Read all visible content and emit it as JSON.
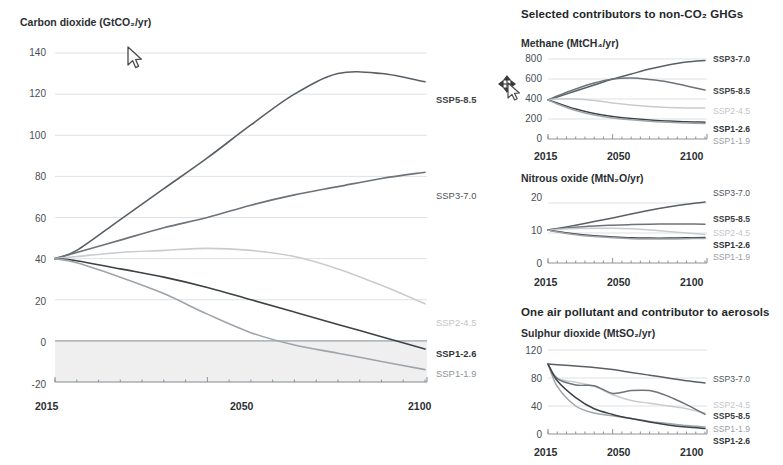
{
  "figure": {
    "top_cut_text": "",
    "cursors": [
      {
        "name": "arrow-cursor",
        "x": 128,
        "y": 50,
        "type": "arrow"
      },
      {
        "name": "move-cursor",
        "x": 500,
        "y": 78,
        "type": "move"
      }
    ]
  },
  "colors": {
    "ssp5_8_5": "#595f64",
    "ssp3_7_0": "#6d7378",
    "ssp2_4_5": "#c9cccf",
    "ssp1_2_6": "#3d4246",
    "ssp1_1_9": "#9ea4a9",
    "grid": "#dfe1e3",
    "axis": "#8d9398",
    "negative_band": "#efeff0",
    "text": "#2b2f33"
  },
  "panels": {
    "co2": {
      "axis_title": "Carbon dioxide (GtCO₂/yr)",
      "yticks": [
        "140",
        "120",
        "100",
        "80",
        "60",
        "40",
        "20",
        "0",
        "-20"
      ],
      "xticks": [
        "2015",
        "2050",
        "2100"
      ],
      "series_labels": [
        {
          "text": "SSP5-8.5",
          "bold": true,
          "color": "#3d4246"
        },
        {
          "text": "SSP3-7.0",
          "bold": false,
          "color": "#4f5459"
        },
        {
          "text": "SSP2-4.5",
          "bold": false,
          "color": "#c2c6c9"
        },
        {
          "text": "SSP1-2.6",
          "bold": true,
          "color": "#2f3337"
        },
        {
          "text": "SSP1-1.9",
          "bold": false,
          "color": "#8d9398"
        }
      ]
    },
    "nonco2_head": "Selected contributors to non-CO₂ GHGs",
    "ch4": {
      "axis_title": "Methane (MtCH₄/yr)",
      "yticks": [
        "800",
        "600",
        "400",
        "200",
        "0"
      ],
      "xticks": [
        "2015",
        "2050",
        "2100"
      ],
      "series_labels": [
        {
          "text": "SSP3-7.0",
          "bold": true,
          "color": "#3d4246"
        },
        {
          "text": "SSP5-8.5",
          "bold": true,
          "color": "#3d4246"
        },
        {
          "text": "SSP2-4.5",
          "bold": false,
          "color": "#c2c6c9"
        },
        {
          "text": "SSP1-2.6",
          "bold": true,
          "color": "#2f3337"
        },
        {
          "text": "SSP1-1.9",
          "bold": false,
          "color": "#9aa0a5"
        }
      ]
    },
    "n2o": {
      "axis_title": "Nitrous oxide (MtN₂O/yr)",
      "yticks": [
        "20",
        "10",
        "0"
      ],
      "xticks": [
        "2015",
        "2050",
        "2100"
      ],
      "series_labels": [
        {
          "text": "SSP3-7.0",
          "bold": false,
          "color": "#4f5459"
        },
        {
          "text": "SSP5-8.5",
          "bold": true,
          "color": "#3d4246"
        },
        {
          "text": "SSP2-4.5",
          "bold": false,
          "color": "#c2c6c9"
        },
        {
          "text": "SSP1-2.6",
          "bold": true,
          "color": "#2f3337"
        },
        {
          "text": "SSP1-1.9",
          "bold": false,
          "color": "#9aa0a5"
        }
      ]
    },
    "aerosol_head": "One air pollutant and contributor to aerosols",
    "so2": {
      "axis_title": "Sulphur dioxide (MtSO₂/yr)",
      "yticks": [
        "120",
        "80",
        "40",
        "0"
      ],
      "xticks": [
        "2015",
        "2050",
        "2100"
      ],
      "series_labels": [
        {
          "text": "SSP3-7.0",
          "bold": false,
          "color": "#4f5459"
        },
        {
          "text": "SSP2-4.5",
          "bold": false,
          "color": "#c2c6c9"
        },
        {
          "text": "SSP5-8.5",
          "bold": true,
          "color": "#3d4246"
        },
        {
          "text": "SSP1-1.9",
          "bold": false,
          "color": "#9aa0a5"
        },
        {
          "text": "SSP1-2.6",
          "bold": true,
          "color": "#2f3337"
        }
      ]
    }
  },
  "chart_data": [
    {
      "id": "co2",
      "type": "line",
      "title": "Carbon dioxide (GtCO₂/yr)",
      "xlabel": "",
      "ylabel": "GtCO2/yr",
      "xlim": [
        2015,
        2100
      ],
      "ylim": [
        -20,
        140
      ],
      "yticks": [
        -20,
        0,
        20,
        40,
        60,
        80,
        100,
        120,
        140
      ],
      "xticks": [
        2015,
        2050,
        2100
      ],
      "grid": true,
      "legend": "right-inline",
      "negative_band": [
        -20,
        0
      ],
      "x": [
        2015,
        2020,
        2030,
        2040,
        2050,
        2060,
        2070,
        2080,
        2090,
        2100
      ],
      "series": [
        {
          "name": "SSP5-8.5",
          "color": "#595f64",
          "values": [
            40,
            44,
            59,
            74,
            89,
            105,
            120,
            130,
            130,
            126
          ]
        },
        {
          "name": "SSP3-7.0",
          "color": "#6d7378",
          "values": [
            40,
            43,
            49,
            55,
            60,
            66,
            71,
            75,
            79,
            82
          ]
        },
        {
          "name": "SSP2-4.5",
          "color": "#c9cccf",
          "values": [
            40,
            41,
            43,
            44,
            45,
            44,
            41,
            35,
            27,
            18
          ]
        },
        {
          "name": "SSP1-2.6",
          "color": "#3d4246",
          "values": [
            40,
            39,
            35,
            31,
            26,
            20,
            14,
            8,
            2,
            -4
          ]
        },
        {
          "name": "SSP1-1.9",
          "color": "#9ea4a9",
          "values": [
            40,
            38,
            31,
            23,
            13,
            4,
            -2,
            -6,
            -10,
            -14
          ]
        }
      ]
    },
    {
      "id": "ch4",
      "type": "line",
      "title": "Methane (MtCH₄/yr)",
      "xlabel": "",
      "ylabel": "MtCH4/yr",
      "xlim": [
        2015,
        2100
      ],
      "ylim": [
        0,
        800
      ],
      "yticks": [
        0,
        200,
        400,
        600,
        800
      ],
      "xticks": [
        2015,
        2050,
        2100
      ],
      "grid": true,
      "legend": "right-inline",
      "x": [
        2015,
        2020,
        2030,
        2040,
        2050,
        2060,
        2070,
        2080,
        2090,
        2100
      ],
      "series": [
        {
          "name": "SSP3-7.0",
          "color": "#595f64",
          "values": [
            390,
            420,
            480,
            540,
            600,
            650,
            700,
            740,
            770,
            785
          ]
        },
        {
          "name": "SSP5-8.5",
          "color": "#6d7378",
          "values": [
            390,
            430,
            500,
            560,
            600,
            610,
            595,
            570,
            530,
            490
          ]
        },
        {
          "name": "SSP2-4.5",
          "color": "#c9cccf",
          "values": [
            390,
            400,
            400,
            385,
            360,
            340,
            325,
            315,
            310,
            310
          ]
        },
        {
          "name": "SSP1-2.6",
          "color": "#3d4246",
          "values": [
            390,
            360,
            300,
            255,
            225,
            205,
            190,
            180,
            172,
            168
          ]
        },
        {
          "name": "SSP1-1.9",
          "color": "#9ea4a9",
          "values": [
            390,
            350,
            285,
            240,
            210,
            192,
            178,
            168,
            160,
            155
          ]
        }
      ]
    },
    {
      "id": "n2o",
      "type": "line",
      "title": "Nitrous oxide (MtN₂O/yr)",
      "xlabel": "",
      "ylabel": "MtN2O/yr",
      "xlim": [
        2015,
        2100
      ],
      "ylim": [
        0,
        22
      ],
      "yticks": [
        0,
        10,
        20
      ],
      "xticks": [
        2015,
        2050,
        2100
      ],
      "grid": true,
      "legend": "right-inline",
      "x": [
        2015,
        2020,
        2030,
        2040,
        2050,
        2060,
        2070,
        2080,
        2090,
        2100
      ],
      "series": [
        {
          "name": "SSP3-7.0",
          "color": "#595f64",
          "values": [
            11.0,
            11.5,
            12.6,
            13.8,
            15.0,
            16.3,
            17.6,
            18.7,
            19.6,
            20.3
          ]
        },
        {
          "name": "SSP5-8.5",
          "color": "#6d7378",
          "values": [
            11.0,
            11.3,
            11.9,
            12.3,
            12.6,
            12.8,
            12.9,
            13.0,
            13.0,
            12.9
          ]
        },
        {
          "name": "SSP2-4.5",
          "color": "#c9cccf",
          "values": [
            11.0,
            11.2,
            11.5,
            11.6,
            11.6,
            11.4,
            11.0,
            10.5,
            10.0,
            9.5
          ]
        },
        {
          "name": "SSP1-2.6",
          "color": "#3d4246",
          "values": [
            11.0,
            10.5,
            9.7,
            9.1,
            8.7,
            8.4,
            8.3,
            8.3,
            8.4,
            8.5
          ]
        },
        {
          "name": "SSP1-1.9",
          "color": "#9ea4a9",
          "values": [
            11.0,
            10.3,
            9.4,
            8.8,
            8.4,
            8.1,
            8.0,
            8.0,
            8.1,
            8.2
          ]
        }
      ]
    },
    {
      "id": "so2",
      "type": "line",
      "title": "Sulphur dioxide (MtSO₂/yr)",
      "xlabel": "",
      "ylabel": "MtSO2/yr",
      "xlim": [
        2015,
        2100
      ],
      "ylim": [
        0,
        120
      ],
      "yticks": [
        0,
        40,
        80,
        120
      ],
      "xticks": [
        2015,
        2050,
        2100
      ],
      "grid": true,
      "legend": "right-inline",
      "x": [
        2015,
        2020,
        2030,
        2040,
        2050,
        2060,
        2070,
        2080,
        2090,
        2100
      ],
      "series": [
        {
          "name": "SSP3-7.0",
          "color": "#595f64",
          "values": [
            100,
            99,
            97,
            95,
            92,
            88,
            84,
            80,
            76,
            73
          ]
        },
        {
          "name": "SSP2-4.5",
          "color": "#c9cccf",
          "values": [
            100,
            80,
            74,
            68,
            56,
            48,
            44,
            40,
            36,
            30
          ]
        },
        {
          "name": "SSP5-8.5",
          "color": "#6d7378",
          "values": [
            100,
            79,
            70,
            69,
            58,
            62,
            62,
            54,
            42,
            28
          ]
        },
        {
          "name": "SSP1-1.9",
          "color": "#9ea4a9",
          "values": [
            100,
            68,
            40,
            30,
            26,
            22,
            18,
            15,
            12,
            10
          ]
        },
        {
          "name": "SSP1-2.6",
          "color": "#3d4246",
          "values": [
            100,
            76,
            52,
            36,
            28,
            22,
            17,
            13,
            10,
            8
          ]
        }
      ]
    }
  ]
}
